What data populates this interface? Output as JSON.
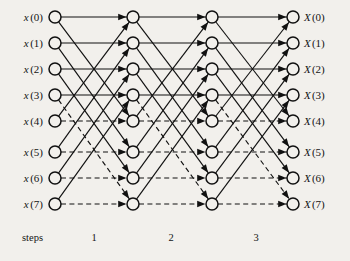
{
  "diagram": {
    "type": "fft-butterfly-flow-graph",
    "n_points": 8,
    "n_stages": 3,
    "background_color": "#f2f0ec",
    "line_color": "#111111",
    "node_fill": "#f2f0ec"
  },
  "inputs": [
    {
      "name": "x",
      "index": "(0)",
      "label": "x (0)"
    },
    {
      "name": "x",
      "index": "(1)",
      "label": "x (1)"
    },
    {
      "name": "x",
      "index": "(2)",
      "label": "x (2)"
    },
    {
      "name": "x",
      "index": "(3)",
      "label": "x (3)"
    },
    {
      "name": "x",
      "index": "(4)",
      "label": "x (4)"
    },
    {
      "name": "x",
      "index": "(5)",
      "label": "x (5)"
    },
    {
      "name": "x",
      "index": "(6)",
      "label": "x (6)"
    },
    {
      "name": "x",
      "index": "(7)",
      "label": "x (7)"
    }
  ],
  "outputs": [
    {
      "name": "X",
      "index": "(0)",
      "label": "X (0)"
    },
    {
      "name": "X",
      "index": "(1)",
      "label": "X (1)"
    },
    {
      "name": "X",
      "index": "(2)",
      "label": "X (2)"
    },
    {
      "name": "X",
      "index": "(3)",
      "label": "X (3)"
    },
    {
      "name": "X",
      "index": "(4)",
      "label": "X (4)"
    },
    {
      "name": "X",
      "index": "(5)",
      "label": "X (5)"
    },
    {
      "name": "X",
      "index": "(6)",
      "label": "X (6)"
    },
    {
      "name": "X",
      "index": "(7)",
      "label": "X (7)"
    }
  ],
  "steps_axis": {
    "caption": "steps",
    "ticks": [
      "1",
      "2",
      "3"
    ]
  },
  "geometry": {
    "columns_x": [
      55,
      133,
      212,
      293
    ],
    "rows_y": [
      17,
      43,
      69,
      95,
      121,
      152,
      178,
      204
    ],
    "node_radius": 6.0
  },
  "chart_data": {
    "type": "diagram",
    "columns": 4,
    "rows": 8,
    "stages": [
      {
        "step": "1",
        "edges": [
          {
            "from": 0,
            "to": 0,
            "dashed": false
          },
          {
            "from": 0,
            "to": 4,
            "dashed": false
          },
          {
            "from": 1,
            "to": 1,
            "dashed": false
          },
          {
            "from": 1,
            "to": 5,
            "dashed": false
          },
          {
            "from": 2,
            "to": 2,
            "dashed": false
          },
          {
            "from": 2,
            "to": 6,
            "dashed": false
          },
          {
            "from": 3,
            "to": 3,
            "dashed": false
          },
          {
            "from": 3,
            "to": 7,
            "dashed": true
          },
          {
            "from": 4,
            "to": 0,
            "dashed": false
          },
          {
            "from": 4,
            "to": 4,
            "dashed": true
          },
          {
            "from": 5,
            "to": 1,
            "dashed": false
          },
          {
            "from": 5,
            "to": 5,
            "dashed": true
          },
          {
            "from": 6,
            "to": 2,
            "dashed": false
          },
          {
            "from": 6,
            "to": 6,
            "dashed": true
          },
          {
            "from": 7,
            "to": 3,
            "dashed": false
          },
          {
            "from": 7,
            "to": 7,
            "dashed": true
          }
        ]
      },
      {
        "step": "2",
        "edges": [
          {
            "from": 0,
            "to": 0,
            "dashed": false
          },
          {
            "from": 0,
            "to": 4,
            "dashed": false
          },
          {
            "from": 1,
            "to": 1,
            "dashed": false
          },
          {
            "from": 1,
            "to": 5,
            "dashed": false
          },
          {
            "from": 2,
            "to": 2,
            "dashed": false
          },
          {
            "from": 2,
            "to": 6,
            "dashed": false
          },
          {
            "from": 3,
            "to": 3,
            "dashed": false
          },
          {
            "from": 3,
            "to": 7,
            "dashed": true
          },
          {
            "from": 4,
            "to": 0,
            "dashed": false
          },
          {
            "from": 4,
            "to": 4,
            "dashed": true
          },
          {
            "from": 5,
            "to": 1,
            "dashed": false
          },
          {
            "from": 5,
            "to": 5,
            "dashed": true
          },
          {
            "from": 6,
            "to": 2,
            "dashed": false
          },
          {
            "from": 6,
            "to": 6,
            "dashed": true
          },
          {
            "from": 7,
            "to": 3,
            "dashed": false
          },
          {
            "from": 7,
            "to": 7,
            "dashed": true
          }
        ]
      },
      {
        "step": "3",
        "edges": [
          {
            "from": 0,
            "to": 0,
            "dashed": false
          },
          {
            "from": 0,
            "to": 4,
            "dashed": false
          },
          {
            "from": 1,
            "to": 1,
            "dashed": false
          },
          {
            "from": 1,
            "to": 5,
            "dashed": false
          },
          {
            "from": 2,
            "to": 2,
            "dashed": false
          },
          {
            "from": 2,
            "to": 6,
            "dashed": false
          },
          {
            "from": 3,
            "to": 3,
            "dashed": false
          },
          {
            "from": 3,
            "to": 7,
            "dashed": true
          },
          {
            "from": 4,
            "to": 0,
            "dashed": false
          },
          {
            "from": 4,
            "to": 4,
            "dashed": true
          },
          {
            "from": 5,
            "to": 1,
            "dashed": false
          },
          {
            "from": 5,
            "to": 5,
            "dashed": true
          },
          {
            "from": 6,
            "to": 2,
            "dashed": false
          },
          {
            "from": 6,
            "to": 6,
            "dashed": true
          },
          {
            "from": 7,
            "to": 3,
            "dashed": false
          },
          {
            "from": 7,
            "to": 7,
            "dashed": true
          }
        ]
      }
    ]
  }
}
